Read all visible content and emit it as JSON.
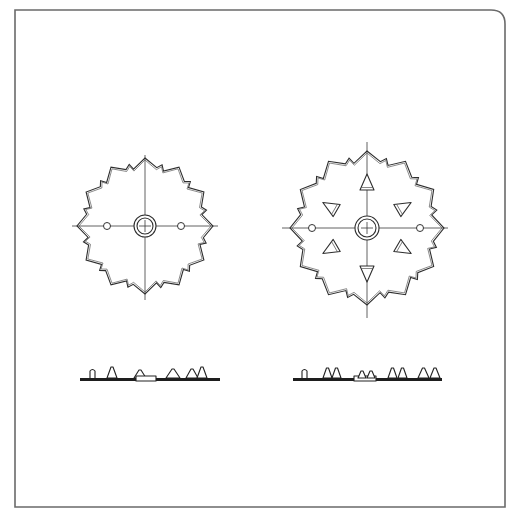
{
  "figure": {
    "frame": {
      "x": 15,
      "y": 10,
      "width": 490,
      "height": 497,
      "corner_radius_top_right": 14,
      "stroke": "#6a6a6a"
    },
    "discs": [
      {
        "name": "disc-plain",
        "cx": 145,
        "cy": 226,
        "r_outer": 68,
        "r_inner": 58,
        "lobes": 12,
        "axis_h": [
          72,
          218
        ],
        "axis_v": [
          155,
          300
        ],
        "hub": {
          "r_outer": 11,
          "r_inner": 8
        },
        "holes": [
          {
            "cx": 107,
            "cy": 226,
            "r": 3.5
          },
          {
            "cx": 181,
            "cy": 226,
            "r": 3.5
          }
        ],
        "teeth": []
      },
      {
        "name": "disc-toothed",
        "cx": 367,
        "cy": 228,
        "r_outer": 77,
        "r_inner": 66,
        "lobes": 12,
        "axis_h": [
          282,
          448
        ],
        "axis_v": [
          142,
          318
        ],
        "hub": {
          "r_outer": 12,
          "r_inner": 9
        },
        "holes": [
          {
            "cx": 312,
            "cy": 228,
            "r": 3.5
          },
          {
            "cx": 420,
            "cy": 228,
            "r": 3.5
          }
        ],
        "teeth": [
          {
            "dist": 45,
            "angle": -90
          },
          {
            "dist": 45,
            "angle": 90
          },
          {
            "dist": 42,
            "angle": -30
          },
          {
            "dist": 42,
            "angle": 30
          },
          {
            "dist": 42,
            "angle": 150
          },
          {
            "dist": 42,
            "angle": 210
          }
        ]
      }
    ],
    "profiles": [
      {
        "name": "profile-plain",
        "x1": 80,
        "x2": 220,
        "y": 378,
        "thickness": 3,
        "parts": [
          {
            "type": "post",
            "x": 90,
            "w": 5,
            "h": 9
          },
          {
            "type": "tri",
            "x": 107,
            "w": 10,
            "h": 11
          },
          {
            "type": "tri",
            "x": 134,
            "w": 12,
            "h": 8
          },
          {
            "type": "block",
            "x": 136,
            "w": 20,
            "h": 5
          },
          {
            "type": "tri",
            "x": 166,
            "w": 14,
            "h": 9
          },
          {
            "type": "tri",
            "x": 186,
            "w": 12,
            "h": 9
          },
          {
            "type": "tri",
            "x": 197,
            "w": 10,
            "h": 11
          }
        ]
      },
      {
        "name": "profile-toothed",
        "x1": 293,
        "x2": 442,
        "y": 378,
        "thickness": 3,
        "parts": [
          {
            "type": "post",
            "x": 302,
            "w": 5,
            "h": 9
          },
          {
            "type": "tri",
            "x": 323,
            "w": 9,
            "h": 10
          },
          {
            "type": "tri",
            "x": 332,
            "w": 9,
            "h": 10
          },
          {
            "type": "block",
            "x": 354,
            "w": 22,
            "h": 5
          },
          {
            "type": "tri",
            "x": 358,
            "w": 8,
            "h": 7
          },
          {
            "type": "tri",
            "x": 367,
            "w": 8,
            "h": 7
          },
          {
            "type": "tri",
            "x": 388,
            "w": 9,
            "h": 10
          },
          {
            "type": "tri",
            "x": 398,
            "w": 9,
            "h": 10
          },
          {
            "type": "tri",
            "x": 418,
            "w": 11,
            "h": 10
          },
          {
            "type": "tri",
            "x": 430,
            "w": 10,
            "h": 10
          }
        ]
      }
    ]
  }
}
